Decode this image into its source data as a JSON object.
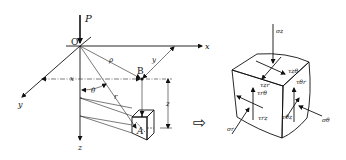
{
  "left_diagram": {
    "load_label": "P",
    "origin_label": "O",
    "axis_x_label": "x",
    "axis_y_label": "y",
    "axis_z_label": "z",
    "point_B_label": "B",
    "point_A_label": "A",
    "rho_label": "ρ",
    "r_label": "r",
    "theta_label": "θ",
    "dim_x_label": "x",
    "dim_y_label": "y",
    "dim_z_label": "z"
  },
  "arrow_symbol": "⇨",
  "right_diagram": {
    "sigma_z": "σz",
    "tau_z_theta": "τzθ",
    "tau_zr": "τzr",
    "tau_theta_r": "τθr",
    "tau_theta_z": "τθz",
    "tau_r_theta": "τrθ",
    "tau_rz": "τrz",
    "sigma_r": "σr",
    "sigma_theta": "σθ"
  }
}
